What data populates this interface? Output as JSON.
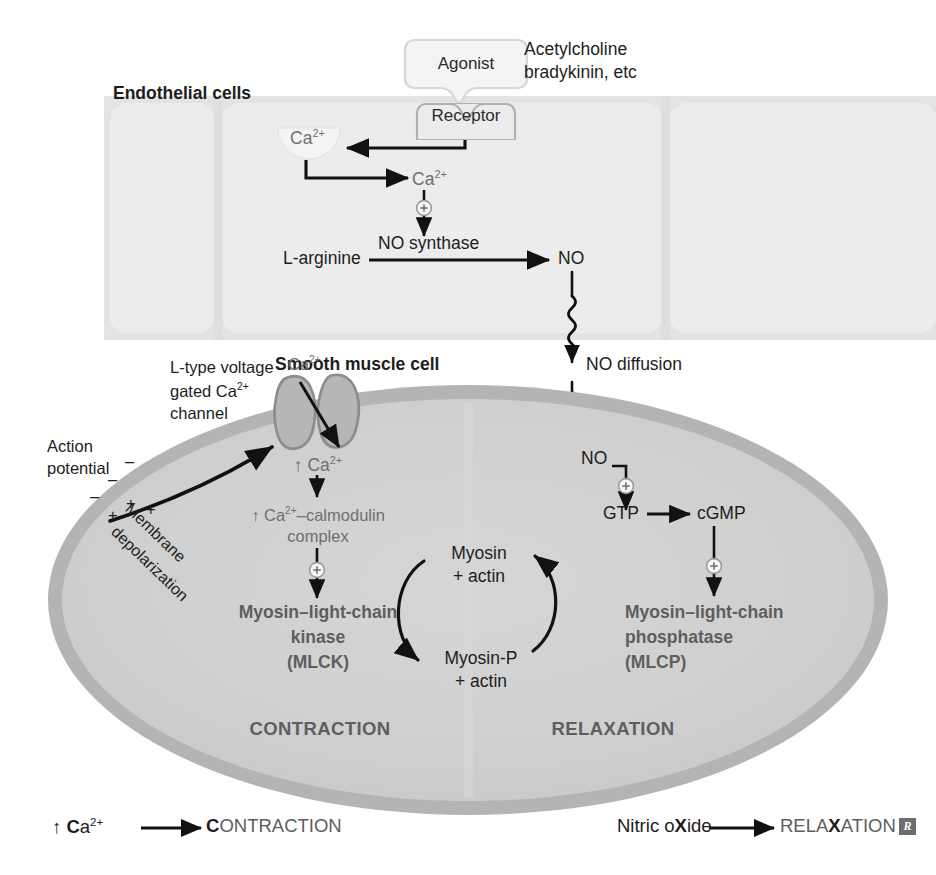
{
  "diagram": {
    "colors": {
      "endothelial_fill": "#e6e6e6",
      "endothelial_light": "#efefef",
      "smc_fill": "#cfcfcf",
      "smc_membrane": "#a8a8a8",
      "arrow": "#111111",
      "text_dark": "#1d1d1d",
      "text_grey": "#6f6f6f",
      "channel_fill": "#b2b2b2",
      "channel_stroke": "#8a8a8a",
      "rx_badge": "#6d6d6d"
    }
  },
  "labels": {
    "endothelial_cells": "Endothelial cells",
    "smooth_muscle_cell": "Smooth muscle cell",
    "agonist": "Agonist",
    "receptor": "Receptor",
    "agonist_examples_line1": "Acetylcholine",
    "agonist_examples_line2": "bradykinin, etc",
    "ca_store": "Ca",
    "ca_store_sup": "2+",
    "ca_cytosol": "Ca",
    "ca_cytosol_sup": "2+",
    "l_arginine": "L-arginine",
    "no_synthase": "NO synthase",
    "no_endothelial": "NO",
    "no_diffusion": "NO diffusion",
    "no_smc": "NO",
    "gtp": "GTP",
    "cgmp": "cGMP",
    "l_type_channel_line1": "L-type voltage",
    "l_type_channel_line2": "gated Ca",
    "l_type_channel_line2_sup": "2+",
    "l_type_channel_line3": "channel",
    "ca_influx_label": "Ca",
    "ca_influx_label_sup": "2+",
    "action_potential_line1": "Action",
    "action_potential_line2": "potential",
    "membrane_depolarization_line1": "Membrane",
    "membrane_depolarization_line2": "depolarization",
    "ca_increase": "↑ Ca",
    "ca_increase_sup": "2+",
    "ca_calmodulin_line1": "↑ Ca",
    "ca_calmodulin_line1_sup": "2+",
    "ca_calmodulin_line1_tail": "–calmodulin",
    "ca_calmodulin_line2": "complex",
    "mlck_line1": "Myosin–light-chain",
    "mlck_line2": "kinase",
    "mlck_line3": "(MLCK)",
    "mlcp_line1": "Myosin–light-chain",
    "mlcp_line2": "phosphatase",
    "mlcp_line3": "(MLCP)",
    "myosin_actin_line1": "Myosin",
    "myosin_actin_line2": "+ actin",
    "myosin_p_actin_line1": "Myosin-P",
    "myosin_p_actin_line2": "+ actin",
    "contraction": "CONTRACTION",
    "relaxation": "RELAXATION",
    "charges_negative": [
      "–",
      "–",
      "–"
    ],
    "charges_positive": [
      "+",
      "+",
      "+"
    ],
    "stimulus_symbol": "+"
  },
  "legend": {
    "left": {
      "source_prefix": "↑ ",
      "source_bold": "C",
      "source_rest": "a",
      "source_sup": "2+",
      "target_bold": "C",
      "target_rest": "ONTRACTION"
    },
    "right": {
      "source_pre": "Nitric o",
      "source_bold": "X",
      "source_post": "ide",
      "target_pre": "RELA",
      "target_bold": "X",
      "target_post": "ATION"
    },
    "badge": "R"
  },
  "icons": {
    "plus_circle": "plus-circle-icon",
    "arrow": "arrow-icon",
    "squiggly_arrow": "squiggly-arrow-icon",
    "rx_badge": "rx-badge-icon",
    "ion_channel": "ion-channel-icon",
    "ca_vesicle": "calcium-store-icon"
  }
}
